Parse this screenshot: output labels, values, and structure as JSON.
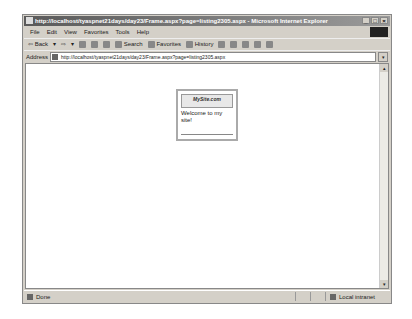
{
  "window": {
    "title": "http://localhost/tyaspnet21days/day23/Frame.aspx?page=listing2305.aspx - Microsoft Internet Explorer",
    "controls": {
      "minimize": "_",
      "maximize": "□",
      "close": "×"
    }
  },
  "menubar": {
    "items": [
      {
        "label": "File"
      },
      {
        "label": "Edit"
      },
      {
        "label": "View"
      },
      {
        "label": "Favorites"
      },
      {
        "label": "Tools"
      },
      {
        "label": "Help"
      }
    ]
  },
  "toolbar": {
    "back_label": "⇦ Back",
    "back_dropdown": "▾",
    "forward_label": "⇨",
    "forward_dropdown": "▾",
    "search_label": "Search",
    "favorites_label": "Favorites",
    "history_label": "History"
  },
  "addressbar": {
    "label": "Address",
    "url": "http://localhost/tyaspnet21days/day23/Frame.aspx?page=listing2305.aspx",
    "dropdown": "▾"
  },
  "content": {
    "banner_text": "MySite.com",
    "message": "Welcome to my site!"
  },
  "scrollbar": {
    "up": "▴",
    "down": "▾"
  },
  "statusbar": {
    "status": "Done",
    "zone": "Local intranet"
  }
}
